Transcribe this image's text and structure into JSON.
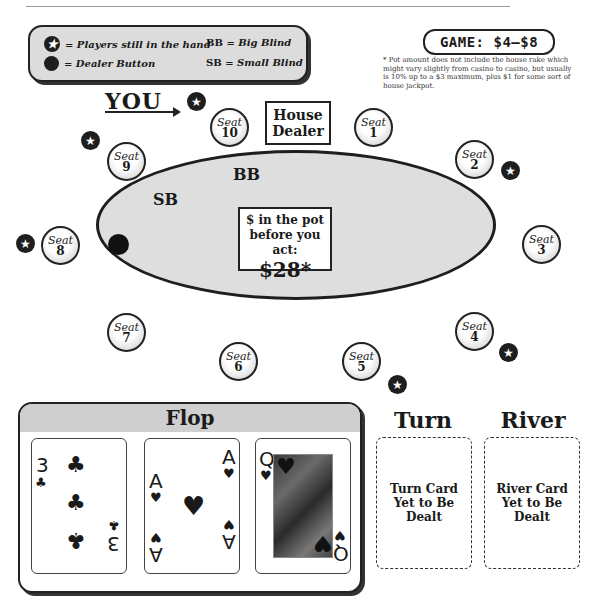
{
  "legend": {
    "players_in_hand": "= Players still in the hand",
    "dealer_button": "= Dealer Button",
    "bb_abbr": "BB",
    "bb_text": " = Big Blind",
    "sb_abbr": "SB",
    "sb_text": " = Small Blind"
  },
  "game": {
    "label": "GAME: $4–$8"
  },
  "footnote": "* Pot amount does not include the house rake which might vary slightly from casino to casino, but usually is 10% up to a $3 maximum, plus $1 for some sort of house jackpot.",
  "you_label": "YOU",
  "house_dealer": {
    "line1": "House",
    "line2": "Dealer"
  },
  "seats": [
    {
      "word": "Seat",
      "num": "1",
      "in_hand": false
    },
    {
      "word": "Seat",
      "num": "2",
      "in_hand": true
    },
    {
      "word": "Seat",
      "num": "3",
      "in_hand": false
    },
    {
      "word": "Seat",
      "num": "4",
      "in_hand": true
    },
    {
      "word": "Seat",
      "num": "5",
      "in_hand": true
    },
    {
      "word": "Seat",
      "num": "6",
      "in_hand": false
    },
    {
      "word": "Seat",
      "num": "7",
      "in_hand": false
    },
    {
      "word": "Seat",
      "num": "8",
      "in_hand": true
    },
    {
      "word": "Seat",
      "num": "9",
      "in_hand": true
    },
    {
      "word": "Seat",
      "num": "10",
      "in_hand": true
    }
  ],
  "table": {
    "bb_label": "BB",
    "sb_label": "SB",
    "pot_line1": "$ in the pot",
    "pot_line2": "before you act:",
    "pot_amount": "$28*"
  },
  "flop": {
    "title": "Flop",
    "cards": [
      {
        "rank": "3",
        "suit": "♣",
        "name": "3 of clubs"
      },
      {
        "rank": "A",
        "suit": "♥",
        "name": "Ace of hearts"
      },
      {
        "rank": "Q",
        "suit": "♥",
        "name": "Queen of hearts"
      }
    ]
  },
  "turn": {
    "title": "Turn",
    "placeholder": "Turn Card Yet to Be Dealt"
  },
  "river": {
    "title": "River",
    "placeholder": "River Card Yet to Be Dealt"
  },
  "icons": {
    "star": "★",
    "suit_club": "♣",
    "suit_heart": "♥"
  }
}
